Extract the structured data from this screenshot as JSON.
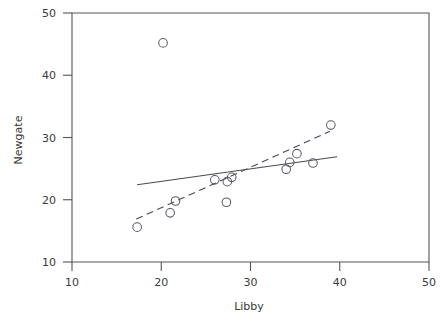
{
  "chart_data": {
    "type": "scatter",
    "title": "",
    "xlabel": "Libby",
    "ylabel": "Newgate",
    "xlim": [
      10,
      50
    ],
    "ylim": [
      10,
      50
    ],
    "xticks": [
      10,
      20,
      30,
      40,
      50
    ],
    "yticks": [
      10,
      20,
      30,
      40,
      50
    ],
    "xtick_labels": [
      "10",
      "20",
      "30",
      "40",
      "50"
    ],
    "ytick_labels": [
      "10",
      "20",
      "30",
      "40",
      "50"
    ],
    "grid": false,
    "legend": "none",
    "marker": "open-circle",
    "points": [
      {
        "x": 17.3,
        "y": 15.6
      },
      {
        "x": 20.2,
        "y": 45.2
      },
      {
        "x": 21.0,
        "y": 17.9
      },
      {
        "x": 21.6,
        "y": 19.8
      },
      {
        "x": 26.0,
        "y": 23.2
      },
      {
        "x": 27.3,
        "y": 19.6
      },
      {
        "x": 27.4,
        "y": 22.9
      },
      {
        "x": 27.9,
        "y": 23.6
      },
      {
        "x": 34.0,
        "y": 24.9
      },
      {
        "x": 34.4,
        "y": 26.0
      },
      {
        "x": 35.2,
        "y": 27.4
      },
      {
        "x": 37.0,
        "y": 25.9
      },
      {
        "x": 39.0,
        "y": 32.0
      }
    ],
    "series": [
      {
        "name": "solid-fit-line",
        "style": "solid",
        "x": [
          17.3,
          39.7
        ],
        "y": [
          22.4,
          26.9
        ]
      },
      {
        "name": "dashed-fit-line",
        "style": "dashed",
        "x": [
          17.2,
          38.9
        ],
        "y": [
          16.9,
          31.0
        ]
      }
    ]
  },
  "axes": {
    "x_title": "Libby",
    "y_title": "Newgate"
  }
}
